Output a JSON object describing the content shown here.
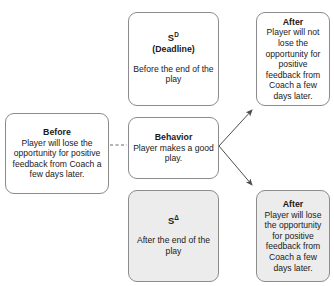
{
  "diagram": {
    "type": "abc-contingency-diagram",
    "boxes": {
      "discriminative_stimulus": {
        "title": "S",
        "title_sup": "D",
        "subtitle": "(Deadline)",
        "body": "Before the end of the play"
      },
      "after_positive": {
        "title": "After",
        "body": "Player will not lose the opportunity for positive feedback from Coach a few days later."
      },
      "before": {
        "title": "Before",
        "body": "Player will lose the opportunity for positive feedback from Coach a few days later."
      },
      "behavior": {
        "title": "Behavior",
        "body": "Player makes a good play."
      },
      "s_delta": {
        "title": "S",
        "title_sup": "Δ",
        "body": "After the end of the play"
      },
      "after_negative": {
        "title": "After",
        "body": "Player will lose the opportunity for positive feedback from Coach a few days later."
      }
    },
    "connectors": [
      {
        "name": "before-to-behavior",
        "style": "dashed",
        "arrow": false
      },
      {
        "name": "behavior-to-after-positive",
        "style": "solid",
        "arrow": true
      },
      {
        "name": "behavior-to-after-negative",
        "style": "solid",
        "arrow": true
      }
    ],
    "colors": {
      "border": "#8c8c8c",
      "shaded_fill": "#ececec",
      "plain_fill": "#ffffff",
      "text": "#1a1a1a",
      "connector": "#4d4d4d"
    }
  }
}
